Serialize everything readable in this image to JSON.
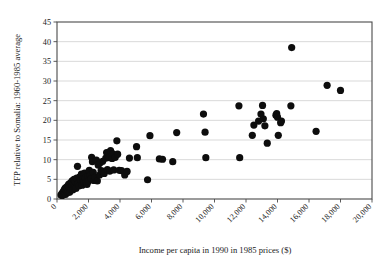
{
  "chart_data": {
    "type": "scatter",
    "title": "",
    "xlabel": "Income per capita in 1990 in 1985 prices ($)",
    "ylabel": "TFP relative to Somalia: 1960-1985 average",
    "xlim": [
      0,
      20000
    ],
    "ylim": [
      0,
      45
    ],
    "xticks": [
      0,
      2000,
      4000,
      6000,
      8000,
      10000,
      12000,
      14000,
      16000,
      18000,
      20000
    ],
    "xtick_labels": [
      "0",
      "2,000",
      "4,000",
      "6,000",
      "8,000",
      "10,000",
      "12,000",
      "14,000",
      "16,000",
      "18,000",
      "20,000"
    ],
    "yticks": [
      0,
      5,
      10,
      15,
      20,
      25,
      30,
      35,
      40,
      45
    ],
    "ytick_labels": [
      "0",
      "5",
      "10",
      "15",
      "20",
      "25",
      "30",
      "35",
      "40",
      "45"
    ],
    "grid": "horizontal",
    "legend": "none",
    "marker_color": "#0d0d0d",
    "marker_size": 3.6,
    "points": [
      [
        250,
        1.0
      ],
      [
        300,
        1.3
      ],
      [
        330,
        0.9
      ],
      [
        360,
        1.6
      ],
      [
        390,
        1.1
      ],
      [
        420,
        2.0
      ],
      [
        450,
        1.4
      ],
      [
        470,
        2.4
      ],
      [
        500,
        1.8
      ],
      [
        520,
        2.8
      ],
      [
        550,
        1.2
      ],
      [
        580,
        2.2
      ],
      [
        610,
        3.0
      ],
      [
        640,
        1.9
      ],
      [
        660,
        2.6
      ],
      [
        700,
        3.4
      ],
      [
        720,
        2.1
      ],
      [
        750,
        3.8
      ],
      [
        780,
        2.9
      ],
      [
        800,
        1.7
      ],
      [
        840,
        3.2
      ],
      [
        870,
        4.1
      ],
      [
        900,
        2.5
      ],
      [
        930,
        3.6
      ],
      [
        960,
        4.6
      ],
      [
        1000,
        2.3
      ],
      [
        1050,
        3.9
      ],
      [
        1080,
        5.0
      ],
      [
        1120,
        3.1
      ],
      [
        1160,
        4.4
      ],
      [
        1200,
        2.7
      ],
      [
        1250,
        5.3
      ],
      [
        1300,
        8.3
      ],
      [
        1350,
        4.0
      ],
      [
        1400,
        3.3
      ],
      [
        1450,
        5.6
      ],
      [
        1500,
        4.8
      ],
      [
        1550,
        6.3
      ],
      [
        1600,
        3.5
      ],
      [
        1650,
        5.1
      ],
      [
        1700,
        4.3
      ],
      [
        1750,
        6.6
      ],
      [
        1800,
        5.4
      ],
      [
        1850,
        4.2
      ],
      [
        1900,
        3.7
      ],
      [
        1950,
        5.8
      ],
      [
        2000,
        4.5
      ],
      [
        2050,
        7.3
      ],
      [
        2100,
        6.0
      ],
      [
        2150,
        5.2
      ],
      [
        2200,
        10.6
      ],
      [
        2250,
        9.5
      ],
      [
        2300,
        6.8
      ],
      [
        2350,
        4.7
      ],
      [
        2400,
        5.5
      ],
      [
        2500,
        9.9
      ],
      [
        2560,
        4.6
      ],
      [
        2620,
        8.6
      ],
      [
        2700,
        6.1
      ],
      [
        2750,
        9.2
      ],
      [
        2800,
        7.2
      ],
      [
        2900,
        9.6
      ],
      [
        2950,
        7.0
      ],
      [
        3000,
        6.5
      ],
      [
        3100,
        10.4
      ],
      [
        3150,
        11.8
      ],
      [
        3200,
        7.5
      ],
      [
        3300,
        10.5
      ],
      [
        3350,
        7.1
      ],
      [
        3400,
        12.3
      ],
      [
        3500,
        10.3
      ],
      [
        3550,
        11.5
      ],
      [
        3600,
        7.4
      ],
      [
        3700,
        10.6
      ],
      [
        3800,
        14.8
      ],
      [
        3850,
        11.4
      ],
      [
        3950,
        7.3
      ],
      [
        4100,
        7.2
      ],
      [
        4300,
        6.1
      ],
      [
        4450,
        7.0
      ],
      [
        4600,
        10.4
      ],
      [
        5050,
        13.3
      ],
      [
        5100,
        10.5
      ],
      [
        5750,
        4.9
      ],
      [
        5900,
        16.1
      ],
      [
        6500,
        10.2
      ],
      [
        6700,
        10.1
      ],
      [
        7350,
        9.5
      ],
      [
        7600,
        16.9
      ],
      [
        9300,
        21.6
      ],
      [
        9400,
        17.0
      ],
      [
        9450,
        10.5
      ],
      [
        11550,
        23.7
      ],
      [
        11600,
        10.5
      ],
      [
        12400,
        16.2
      ],
      [
        12500,
        18.8
      ],
      [
        12800,
        19.8
      ],
      [
        12950,
        21.6
      ],
      [
        13050,
        23.8
      ],
      [
        13100,
        20.4
      ],
      [
        13200,
        18.6
      ],
      [
        13350,
        14.2
      ],
      [
        13900,
        21.3
      ],
      [
        13950,
        21.7
      ],
      [
        14000,
        20.8
      ],
      [
        14050,
        16.2
      ],
      [
        14200,
        19.4
      ],
      [
        14250,
        19.8
      ],
      [
        14850,
        23.7
      ],
      [
        14900,
        38.5
      ],
      [
        16450,
        17.2
      ],
      [
        17150,
        28.9
      ],
      [
        18000,
        27.6
      ]
    ]
  }
}
